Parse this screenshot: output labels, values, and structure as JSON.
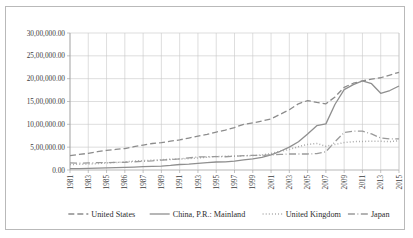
{
  "chart_data": {
    "type": "line",
    "title": "",
    "xlabel": "",
    "ylabel": "",
    "ylim": [
      0,
      3000000
    ],
    "grid": true,
    "legend_position": "bottom",
    "y_ticks": [
      0,
      500000,
      1000000,
      1500000,
      2000000,
      2500000,
      3000000
    ],
    "y_tick_labels": [
      "0.00",
      "5,00,000.00",
      "10,00,000.00",
      "15,00,000.00",
      "20,00,000.00",
      "25,00,000.00",
      "30,00,000.00"
    ],
    "x": [
      1981,
      1982,
      1983,
      1984,
      1985,
      1986,
      1987,
      1988,
      1989,
      1990,
      1991,
      1992,
      1993,
      1994,
      1995,
      1996,
      1997,
      1998,
      1999,
      2000,
      2001,
      2002,
      2003,
      2004,
      2005,
      2006,
      2007,
      2008,
      2009,
      2010,
      2011,
      2012,
      2013,
      2014,
      2015,
      2016,
      2017
    ],
    "x_tick_labels": [
      "1981",
      "1983",
      "1985",
      "1986",
      "1987",
      "1989",
      "1991",
      "1993",
      "1995",
      "1997",
      "1999",
      "2001",
      "2003",
      "2005",
      "2007",
      "2009",
      "2011",
      "2013",
      "2015",
      "2017"
    ],
    "series": [
      {
        "name": "United States",
        "style": "dashed",
        "color": "#8c8c8c",
        "values": [
          315000,
          340000,
          365000,
          400000,
          430000,
          450000,
          470000,
          510000,
          545000,
          580000,
          600000,
          630000,
          660000,
          700000,
          740000,
          780000,
          830000,
          875000,
          930000,
          1000000,
          1030000,
          1070000,
          1120000,
          1220000,
          1320000,
          1450000,
          1520000,
          1480000,
          1450000,
          1600000,
          1810000,
          1900000,
          1950000,
          1990000,
          2020000,
          2080000,
          2140000
        ]
      },
      {
        "name": "China, P.R.: Mainland",
        "style": "solid",
        "color": "#8f8f8f",
        "values": [
          30000,
          32000,
          35000,
          40000,
          45000,
          50000,
          56000,
          65000,
          72000,
          78000,
          85000,
          100000,
          120000,
          130000,
          145000,
          160000,
          175000,
          180000,
          195000,
          220000,
          245000,
          275000,
          330000,
          410000,
          500000,
          620000,
          790000,
          970000,
          1010000,
          1440000,
          1760000,
          1870000,
          1950000,
          1890000,
          1680000,
          1740000,
          1840000
        ]
      },
      {
        "name": "United Kingdom",
        "style": "dotted",
        "color": "#a3a3a3",
        "values": [
          120000,
          125000,
          130000,
          140000,
          155000,
          165000,
          175000,
          195000,
          205000,
          215000,
          225000,
          235000,
          240000,
          250000,
          265000,
          280000,
          295000,
          300000,
          305000,
          310000,
          315000,
          330000,
          360000,
          410000,
          450000,
          510000,
          560000,
          580000,
          520000,
          560000,
          600000,
          620000,
          625000,
          630000,
          630000,
          620000,
          640000
        ]
      },
      {
        "name": "Japan",
        "style": "dashdot",
        "color": "#9a9a9a",
        "values": [
          155000,
          150000,
          155000,
          160000,
          160000,
          165000,
          170000,
          180000,
          190000,
          200000,
          215000,
          230000,
          245000,
          265000,
          285000,
          290000,
          295000,
          290000,
          300000,
          315000,
          320000,
          320000,
          330000,
          340000,
          350000,
          350000,
          350000,
          360000,
          400000,
          620000,
          820000,
          850000,
          850000,
          790000,
          700000,
          680000,
          680000
        ]
      }
    ]
  },
  "legend": {
    "items": [
      {
        "label": "United States",
        "marker": "dashed"
      },
      {
        "label": "China, P.R.: Mainland",
        "marker": "solid"
      },
      {
        "label": "United Kingdom",
        "marker": "dotted"
      },
      {
        "label": "Japan",
        "marker": "dashdot"
      }
    ]
  }
}
